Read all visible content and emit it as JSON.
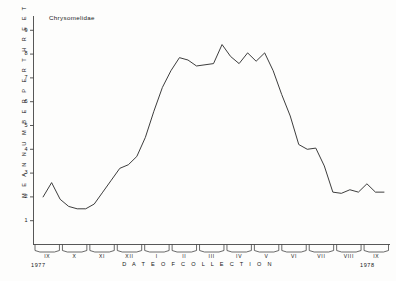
{
  "figure": {
    "title": "Chrysomelidae",
    "ylabel": "M E A N   N U M B E R   P E R   T H R E E   T R A P S",
    "xlabel": "D A T E   O F   C O L L E C T I O N",
    "year_start": "1977",
    "year_end": "1978",
    "line_color": "#333333",
    "axis_color": "#444444",
    "background": "#fdfdfc"
  },
  "chart_data": {
    "type": "line",
    "title": "Chrysomelidae",
    "xlabel": "DATE OF COLLECTION",
    "ylabel": "MEAN NUMBER PER THREE TRAPS",
    "grid": false,
    "legend": null,
    "ylim": [
      0,
      9.6
    ],
    "ytick_labels": [
      "1",
      "2",
      "3",
      "4",
      "5",
      "6",
      "7",
      "8",
      "9"
    ],
    "yticks": [
      1,
      2,
      3,
      4,
      5,
      6,
      7,
      8,
      9
    ],
    "xtick_labels": [
      "IX",
      "X",
      "XI",
      "XII",
      "I",
      "II",
      "III",
      "IV",
      "V",
      "VI",
      "VII",
      "VIII",
      "IX"
    ],
    "x_year_labels": [
      "1977",
      "1978"
    ],
    "series": [
      {
        "name": "Chrysomelidae",
        "x": [
          0,
          1,
          2,
          3,
          4,
          5,
          6,
          7,
          8,
          9,
          10,
          11,
          12,
          13,
          14,
          15,
          16,
          17,
          18,
          19,
          20,
          21,
          22,
          23,
          24,
          25,
          26,
          27,
          28,
          29,
          30,
          31,
          32,
          33,
          34,
          35,
          36,
          37,
          38,
          39,
          40
        ],
        "values": [
          2.0,
          2.6,
          1.9,
          1.6,
          1.5,
          1.5,
          1.7,
          2.2,
          2.7,
          3.2,
          3.35,
          3.7,
          4.5,
          5.6,
          6.6,
          7.3,
          7.85,
          7.75,
          7.5,
          7.55,
          7.6,
          8.4,
          7.9,
          7.6,
          8.05,
          7.7,
          8.05,
          7.3,
          6.3,
          5.4,
          4.2,
          4.0,
          4.05,
          3.3,
          2.2,
          2.15,
          2.3,
          2.2,
          2.55,
          2.2,
          2.2
        ]
      }
    ],
    "annotations": [
      {
        "text": "Chrysomelidae",
        "position": "upper-left"
      }
    ]
  }
}
